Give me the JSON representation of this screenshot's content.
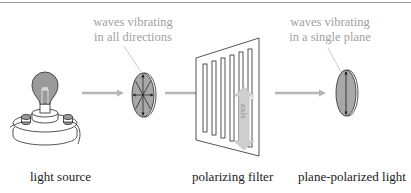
{
  "diagram": {
    "annotations": {
      "unpolarized": [
        "waves vibrating",
        "in all directions"
      ],
      "polarized": [
        "waves vibrating",
        "in a single plane"
      ]
    },
    "filter_axis_label": "axis",
    "labels": {
      "source": "light source",
      "filter": "polarizing filter",
      "output": "plane-polarized light"
    },
    "colors": {
      "arrow": "#b5b5b5",
      "bulb_fill": "#9a9a9a",
      "ellipse_fill": "#a8a8a8",
      "axis_arrow": "#c8c8c8",
      "annotation_text": "#a0a0a0",
      "line": "#2a2a2a"
    }
  }
}
